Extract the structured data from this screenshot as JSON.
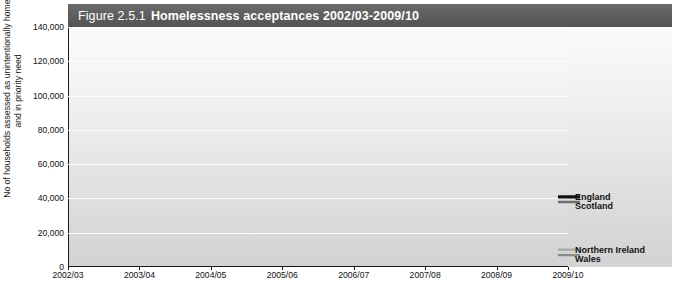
{
  "title": {
    "figure_number": "Figure 2.5.1",
    "text": "Homelessness acceptances 2002/03-2009/10"
  },
  "axis": {
    "y_title": "No of households assessed as unintentionally homeless and in priority need",
    "y_ticks": [
      "0",
      "20,000",
      "40,000",
      "60,000",
      "80,000",
      "100,000",
      "120,000",
      "140,000"
    ],
    "x_ticks": [
      "2002/03",
      "2003/04",
      "2004/05",
      "2005/06",
      "2006/07",
      "2007/08",
      "2008/09",
      "2009/10"
    ]
  },
  "legend": {
    "england": "England",
    "scotland": "Scotland",
    "northern_ireland": "Northern Ireland",
    "wales": "Wales"
  },
  "colors": {
    "england": "#111111",
    "scotland": "#6e6e6e",
    "northern_ireland": "#a8a8a8",
    "wales": "#8a8a8a",
    "title_bar": "#5d5d5d",
    "axis": "#1a1a1a",
    "gridline": "#ffffff"
  },
  "chart_data": {
    "type": "line",
    "title": "Figure 2.5.1 Homelessness acceptances 2002/03-2009/10",
    "xlabel": "",
    "ylabel": "No of households assessed as unintentionally homeless and in priority need",
    "categories": [
      "2002/03",
      "2003/04",
      "2004/05",
      "2005/06",
      "2006/07",
      "2007/08",
      "2008/09",
      "2009/10"
    ],
    "ylim": [
      0,
      140000
    ],
    "ytick_step": 20000,
    "grid": true,
    "legend_position": "right-inline",
    "series": [
      {
        "name": "England",
        "color": "#111111",
        "values": [
          130000,
          136500,
          120900,
          93900,
          73500,
          63200,
          53400,
          40900
        ]
      },
      {
        "name": "Scotland",
        "color": "#6e6e6e",
        "values": [
          27900,
          30700,
          30600,
          32100,
          33200,
          33100,
          32800,
          37900
        ]
      },
      {
        "name": "Northern Ireland",
        "color": "#a8a8a8",
        "values": [
          8500,
          9400,
          10200,
          9900,
          9600,
          9300,
          9500,
          10100
        ]
      },
      {
        "name": "Wales",
        "color": "#8a8a8a",
        "values": [
          8200,
          9200,
          10000,
          9500,
          8900,
          8300,
          7700,
          6900
        ]
      }
    ]
  }
}
